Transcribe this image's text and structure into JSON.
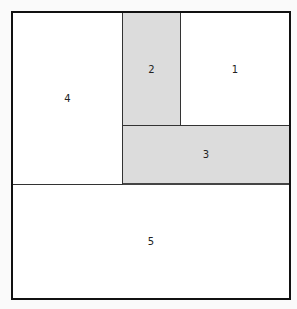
{
  "diagram": {
    "type": "region-partition",
    "regions": [
      {
        "id": "4",
        "label": "4",
        "shaded": false
      },
      {
        "id": "2",
        "label": "2",
        "shaded": true
      },
      {
        "id": "1",
        "label": "1",
        "shaded": false
      },
      {
        "id": "3",
        "label": "3",
        "shaded": true
      },
      {
        "id": "5",
        "label": "5",
        "shaded": false
      }
    ],
    "colors": {
      "shaded": "#dcdcdc",
      "plain": "#ffffff",
      "border": "#111111"
    }
  }
}
